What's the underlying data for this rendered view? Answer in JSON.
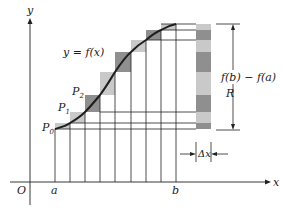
{
  "diagram": {
    "labels": {
      "y_axis": "y",
      "x_axis": "x",
      "origin": "O",
      "a": "a",
      "b": "b",
      "curve": "y = f(x)",
      "p0": "P",
      "p0_sub": "0",
      "p1": "P",
      "p1_sub": "1",
      "p2": "P",
      "p2_sub": "2",
      "rise": "f(b) − f(a)",
      "region": "R",
      "delta_x": "Δx"
    },
    "colors": {
      "line": "#222222",
      "light_fill": "#c9c9c9",
      "dark_fill": "#8f8f8f",
      "background": "#ffffff"
    },
    "partition_x": [
      55,
      70,
      85,
      100,
      115,
      131,
      146,
      161,
      176
    ],
    "curve_y": [
      129,
      123,
      112,
      95,
      72,
      52,
      40,
      30,
      24
    ]
  }
}
